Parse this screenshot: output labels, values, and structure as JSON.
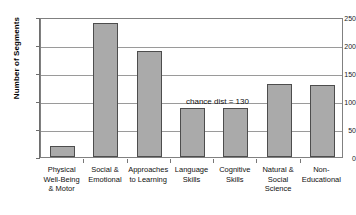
{
  "chart_data": {
    "type": "bar",
    "title": "",
    "xlabel": "",
    "ylabel": "Number of Segments",
    "ylim": [
      0,
      250
    ],
    "ytick_labels": [
      "0",
      "50",
      "100",
      "150",
      "200",
      "250"
    ],
    "yticks": [
      0,
      50,
      100,
      150,
      200,
      250
    ],
    "grid": true,
    "legend": "none",
    "categories": [
      "Physical\nWell-Being\n& Motor",
      "Social &\nEmotional",
      "Approaches\nto Learning",
      "Language\nSkills",
      "Cognitive\nSkills",
      "Natural &\nSocial\nScience",
      "Non-\nEducational"
    ],
    "category_lines": [
      [
        "Physical",
        "Well-Being",
        "& Motor"
      ],
      [
        "Social &",
        "Emotional"
      ],
      [
        "Approaches",
        "to Learning"
      ],
      [
        "Language",
        "Skills"
      ],
      [
        "Cognitive",
        "Skills"
      ],
      [
        "Natural &",
        "Social",
        "Science"
      ],
      [
        "Non-",
        "Educational"
      ]
    ],
    "values": [
      20,
      240,
      190,
      88,
      88,
      130,
      128
    ],
    "annotations": [
      {
        "text": "chance dist = 130",
        "value": 130
      }
    ],
    "colors": {
      "bar_fill": "#aaaaaa",
      "bar_border": "#4d4d4d",
      "gridline": "#9a9a9a",
      "axis": "#6e6e6e",
      "text": "#111111",
      "background": "#ffffff"
    }
  }
}
